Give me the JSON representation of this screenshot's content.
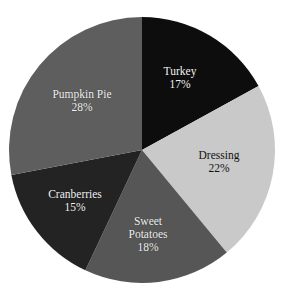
{
  "chart_data": {
    "type": "pie",
    "title": "",
    "xlabel": "",
    "ylabel": "",
    "categories": [
      "Turkey",
      "Dressing",
      "Sweet Potatoes",
      "Cranberries",
      "Pumpkin Pie"
    ],
    "values": [
      17,
      22,
      18,
      15,
      28
    ],
    "value_unit": "%",
    "start_angle_deg": 0,
    "direction": "clockwise",
    "legend": "none",
    "grid": false,
    "background": "#ffffff",
    "slices": [
      {
        "label": "Turkey",
        "value": 17,
        "value_text": "17%",
        "color": "#0d0d0d",
        "label_color": "light",
        "label_lines": [
          "Turkey",
          "17%"
        ],
        "label_x": 180,
        "label_y": 78
      },
      {
        "label": "Dressing",
        "value": 22,
        "value_text": "22%",
        "color": "#c9c9c9",
        "label_color": "dark",
        "label_lines": [
          "Dressing",
          "22%"
        ],
        "label_x": 219,
        "label_y": 162
      },
      {
        "label": "Sweet Potatoes",
        "value": 18,
        "value_text": "18%",
        "color": "#565656",
        "label_color": "light",
        "label_lines": [
          "Sweet",
          "Potatoes",
          "18%"
        ],
        "label_x": 148,
        "label_y": 234
      },
      {
        "label": "Cranberries",
        "value": 15,
        "value_text": "15%",
        "color": "#232323",
        "label_color": "light",
        "label_lines": [
          "Cranberries",
          "15%"
        ],
        "label_x": 75,
        "label_y": 201
      },
      {
        "label": "Pumpkin Pie",
        "value": 28,
        "value_text": "28%",
        "color": "#5e5e5e",
        "label_color": "light",
        "label_lines": [
          "Pumpkin Pie",
          "28%"
        ],
        "label_x": 82,
        "label_y": 101
      }
    ],
    "geometry": {
      "cx": 142,
      "cy": 150,
      "r": 133
    }
  }
}
